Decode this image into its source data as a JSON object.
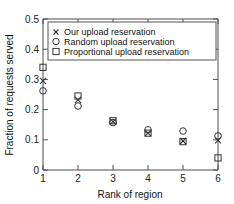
{
  "chart_data": {
    "type": "scatter",
    "title": "",
    "xlabel": "Rank of region",
    "ylabel": "Fraction of requests served",
    "xlim": [
      1,
      6
    ],
    "ylim": [
      0,
      0.5
    ],
    "xticks": [
      "1",
      "2",
      "3",
      "4",
      "5",
      "6"
    ],
    "yticks": [
      "0",
      "0.1",
      "0.2",
      "0.3",
      "0.4",
      "0.5"
    ],
    "grid": false,
    "legend_position": "upper-right",
    "categories": [
      1,
      2,
      3,
      4,
      5,
      6
    ],
    "series": [
      {
        "name": "Our upload reservation",
        "marker": "x",
        "values": [
          0.295,
          0.232,
          0.16,
          0.122,
          0.096,
          0.098
        ]
      },
      {
        "name": "Random upload reservation",
        "marker": "circle",
        "values": [
          0.262,
          0.212,
          0.157,
          0.133,
          0.129,
          0.113
        ]
      },
      {
        "name": "Proportional upload reservation",
        "marker": "square",
        "values": [
          0.34,
          0.245,
          0.163,
          0.122,
          0.094,
          0.04
        ]
      }
    ]
  },
  "legend": {
    "entries": [
      {
        "label": "Our upload reservation",
        "marker": "x-marker-icon"
      },
      {
        "label": "Random upload reservation",
        "marker": "circle-marker-icon"
      },
      {
        "label": "Proportional upload reservation",
        "marker": "square-marker-icon"
      }
    ]
  },
  "colors": {
    "marker": "#333333",
    "axis": "#4d4d4d",
    "text": "#111111",
    "background": "#ffffff"
  }
}
